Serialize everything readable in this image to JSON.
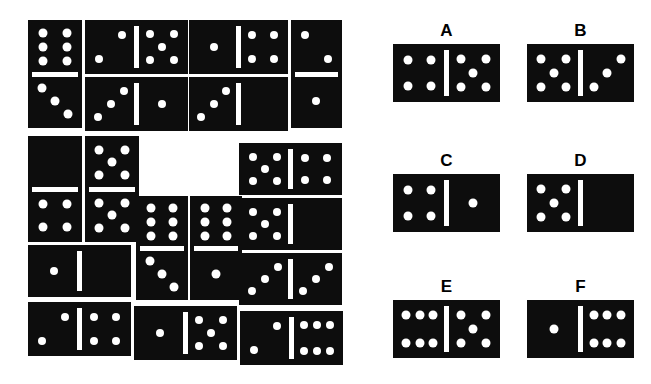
{
  "page": {
    "background_color": "#ffffff",
    "tile_color": "#0d0d0d",
    "pip_color": "#ffffff",
    "width": 651,
    "height": 384
  },
  "puzzle": {
    "description": "Arrangement of domino tiles forming a pattern with a missing tile",
    "tiles": [
      {
        "name": "tile-1",
        "orientation": "vertical",
        "values": [
          6,
          3
        ],
        "x": 28,
        "y": 20,
        "w": 54,
        "h": 108
      },
      {
        "name": "tile-2",
        "orientation": "horizontal",
        "values": [
          2,
          5
        ],
        "x": 85,
        "y": 20,
        "w": 103,
        "h": 54
      },
      {
        "name": "tile-3",
        "orientation": "horizontal",
        "values": [
          3,
          1
        ],
        "x": 85,
        "y": 77,
        "w": 103,
        "h": 54
      },
      {
        "name": "tile-4",
        "orientation": "horizontal",
        "values": [
          1,
          4
        ],
        "x": 189,
        "y": 20,
        "w": 99,
        "h": 54
      },
      {
        "name": "tile-5",
        "orientation": "horizontal",
        "values": [
          3,
          0
        ],
        "x": 189,
        "y": 77,
        "w": 99,
        "h": 54
      },
      {
        "name": "tile-6",
        "orientation": "vertical",
        "values": [
          2,
          1
        ],
        "x": 291,
        "y": 20,
        "w": 51,
        "h": 108
      },
      {
        "name": "tile-7",
        "orientation": "vertical",
        "values": [
          0,
          4
        ],
        "x": 28,
        "y": 136,
        "w": 54,
        "h": 106
      },
      {
        "name": "tile-8",
        "orientation": "vertical",
        "values": [
          5,
          5
        ],
        "x": 85,
        "y": 136,
        "w": 54,
        "h": 106
      },
      {
        "name": "tile-9",
        "orientation": "horizontal",
        "values": [
          5,
          4
        ],
        "x": 239,
        "y": 143,
        "w": 103,
        "h": 52
      },
      {
        "name": "tile-10",
        "orientation": "vertical",
        "values": [
          6,
          3
        ],
        "x": 136,
        "y": 196,
        "w": 52,
        "h": 104
      },
      {
        "name": "tile-11",
        "orientation": "vertical",
        "values": [
          6,
          1
        ],
        "x": 190,
        "y": 196,
        "w": 52,
        "h": 104
      },
      {
        "name": "tile-12",
        "orientation": "horizontal",
        "values": [
          5,
          0
        ],
        "x": 239,
        "y": 198,
        "w": 103,
        "h": 52
      },
      {
        "name": "tile-13",
        "orientation": "horizontal",
        "values": [
          1,
          0
        ],
        "x": 28,
        "y": 245,
        "w": 103,
        "h": 52
      },
      {
        "name": "tile-14",
        "orientation": "horizontal",
        "values": [
          3,
          3
        ],
        "x": 239,
        "y": 253,
        "w": 103,
        "h": 52
      },
      {
        "name": "tile-15",
        "orientation": "horizontal",
        "values": [
          2,
          4
        ],
        "x": 28,
        "y": 302,
        "w": 103,
        "h": 54
      },
      {
        "name": "tile-16",
        "orientation": "horizontal",
        "values": [
          1,
          5
        ],
        "x": 134,
        "y": 306,
        "w": 103,
        "h": 54
      },
      {
        "name": "tile-17",
        "orientation": "horizontal",
        "values": [
          2,
          6
        ],
        "x": 240,
        "y": 311,
        "w": 103,
        "h": 54
      }
    ]
  },
  "options": [
    {
      "label": "A",
      "values": [
        4,
        5
      ],
      "x": 393,
      "y": 22,
      "w": 107,
      "h": 58
    },
    {
      "label": "B",
      "values": [
        5,
        3
      ],
      "x": 527,
      "y": 22,
      "w": 107,
      "h": 58
    },
    {
      "label": "C",
      "values": [
        4,
        1
      ],
      "x": 393,
      "y": 152,
      "w": 107,
      "h": 58
    },
    {
      "label": "D",
      "values": [
        5,
        0
      ],
      "x": 527,
      "y": 152,
      "w": 107,
      "h": 58
    },
    {
      "label": "E",
      "values": [
        6,
        5
      ],
      "x": 393,
      "y": 278,
      "w": 107,
      "h": 58
    },
    {
      "label": "F",
      "values": [
        1,
        6
      ],
      "x": 527,
      "y": 278,
      "w": 107,
      "h": 58
    }
  ]
}
